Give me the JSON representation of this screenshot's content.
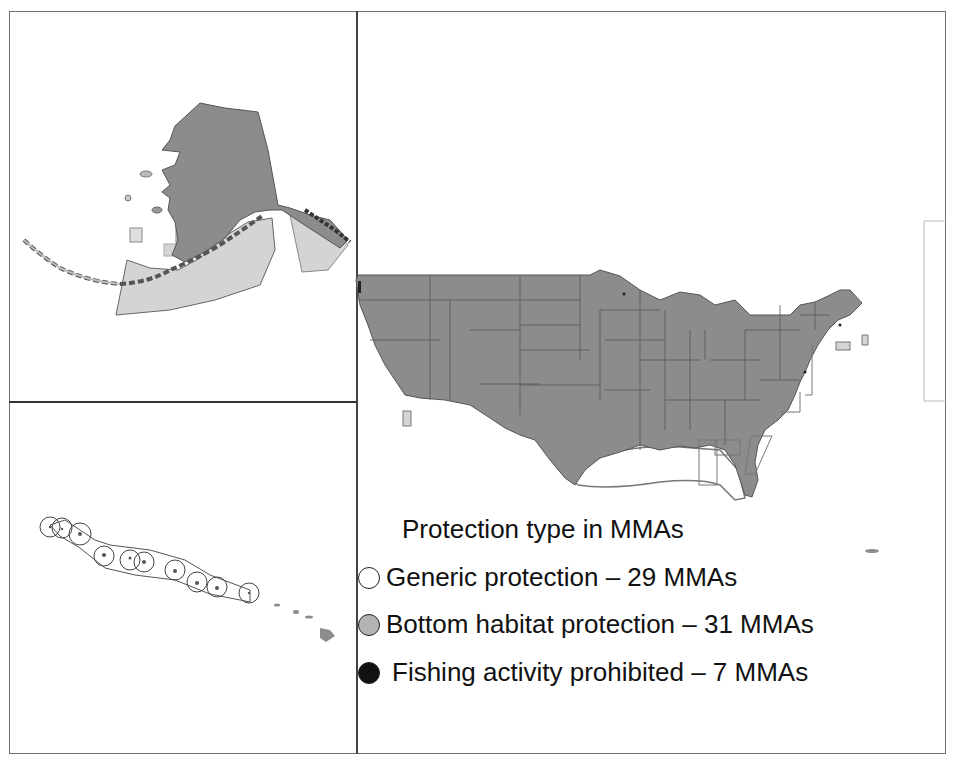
{
  "figure": {
    "panels": [
      {
        "id": "alaska",
        "label": "Alaska inset"
      },
      {
        "id": "hawaii",
        "label": "Hawaii inset"
      },
      {
        "id": "conus",
        "label": "Contiguous United States"
      }
    ]
  },
  "legend": {
    "title": "Protection type in MMAs",
    "items": [
      {
        "label": "Generic protection – 29 MMAs",
        "swatch": "#ffffff",
        "count": 29
      },
      {
        "label": "Bottom habitat protection – 31 MMAs",
        "swatch": "#b4b4b4",
        "count": 31
      },
      {
        "label": "Fishing activity prohibited – 7 MMAs",
        "swatch": "#111111",
        "count": 7
      }
    ]
  },
  "colors": {
    "land": "#8c8c8c",
    "bottom_habitat": "#d4d4d4",
    "generic": "#ffffff",
    "fishing_prohibited": "#111111",
    "border": "#6e6e6e"
  }
}
